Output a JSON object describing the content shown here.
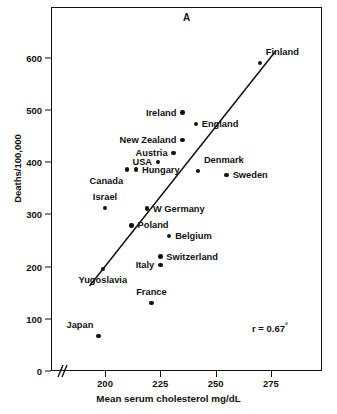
{
  "figure": {
    "panel_letter": "A",
    "background": "#ffffff",
    "ink_color": "#111111"
  },
  "annotation": {
    "correlation_text": "r = 0.67",
    "correlation_superscript": "°"
  },
  "axes": {
    "ylabel": "Deaths/100,000",
    "xlabel": "Mean serum cholesterol mg/dL",
    "yticks": [
      0,
      100,
      200,
      300,
      400,
      500,
      600
    ],
    "ytick_labels": [
      "0",
      "100",
      "200",
      "300",
      "400",
      "500",
      "600"
    ],
    "xticks": [
      200,
      225,
      250,
      275
    ],
    "xtick_labels": [
      "200",
      "225",
      "250",
      "275"
    ],
    "xlim": [
      186,
      295
    ],
    "ylim": [
      0,
      680
    ],
    "x_axis_break": true,
    "grid": false
  },
  "chart_data": {
    "type": "scatter",
    "title": "A",
    "xlabel": "Mean serum cholesterol mg/dL",
    "ylabel": "Deaths/100,000",
    "xlim": [
      186,
      295
    ],
    "ylim": [
      0,
      680
    ],
    "grid": false,
    "legend": "none",
    "correlation": 0.67,
    "annotations": [
      "r = 0.67°"
    ],
    "trendline": {
      "type": "linear-fit",
      "x_start": 193,
      "y_start": 163,
      "x_end": 277,
      "y_end": 612
    },
    "points": [
      {
        "label": "Finland",
        "x": 270,
        "y": 590,
        "label_pos": "above-right"
      },
      {
        "label": "Ireland",
        "x": 235,
        "y": 495,
        "label_pos": "left"
      },
      {
        "label": "England",
        "x": 241,
        "y": 473,
        "label_pos": "right"
      },
      {
        "label": "New Zealand",
        "x": 235,
        "y": 442,
        "label_pos": "left"
      },
      {
        "label": "Austria",
        "x": 231,
        "y": 418,
        "label_pos": "left"
      },
      {
        "label": "USA",
        "x": 224,
        "y": 400,
        "label_pos": "left"
      },
      {
        "label": "Hungary",
        "x": 214,
        "y": 386,
        "label_pos": "right"
      },
      {
        "label": "Canada",
        "x": 210,
        "y": 386,
        "label_pos": "below-left"
      },
      {
        "label": "Denmark",
        "x": 242,
        "y": 383,
        "label_pos": "above-right"
      },
      {
        "label": "Sweden",
        "x": 255,
        "y": 375,
        "label_pos": "right"
      },
      {
        "label": "Israel",
        "x": 200,
        "y": 312,
        "label_pos": "above"
      },
      {
        "label": "W Germany",
        "x": 219,
        "y": 311,
        "label_pos": "right"
      },
      {
        "label": "Poland",
        "x": 212,
        "y": 279,
        "label_pos": "right"
      },
      {
        "label": "Belgium",
        "x": 229,
        "y": 259,
        "label_pos": "right"
      },
      {
        "label": "Switzerland",
        "x": 225,
        "y": 219,
        "label_pos": "right"
      },
      {
        "label": "Italy",
        "x": 225,
        "y": 203,
        "label_pos": "left"
      },
      {
        "label": "Yugoslavia",
        "x": 199,
        "y": 196,
        "label_pos": "below"
      },
      {
        "label": "France",
        "x": 221,
        "y": 130,
        "label_pos": "above"
      },
      {
        "label": "Japan",
        "x": 197,
        "y": 67,
        "label_pos": "above-left"
      }
    ]
  }
}
